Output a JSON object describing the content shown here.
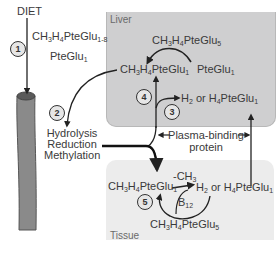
{
  "regions": {
    "liver": "Liver",
    "tissue": "Tissue"
  },
  "diet": {
    "label": "DIET",
    "compound_main": "CH3H4PteGlu",
    "compound_main_sub": "1-8",
    "compound_secondary": "PteGlu",
    "compound_secondary_sub": "1"
  },
  "steps": [
    "1",
    "2",
    "3",
    "4",
    "5"
  ],
  "gut": {
    "process_lines": [
      "Hydrolysis",
      "Reduction",
      "Methylation"
    ]
  },
  "liver": {
    "ch3h4pteglu5": "CH3H4PteGlu5",
    "ch3h4pteglu1": "CH3H4PteGlu1",
    "pteglu1": "PteGlu1",
    "h2_or_h4pteglu1": "H2 or H4PteGlu1"
  },
  "plasma": {
    "line1": "Plasma-binding",
    "line2": "protein"
  },
  "tissue": {
    "ch3h4pteglu1": "CH3H4PteGlu1",
    "methyl_label": "-CH3",
    "h2_or_h4pteglu1": "H2 or H4PteGlu1",
    "cofactor": "B12",
    "ch3h4pteglu5": "CH3H4PteGlu5"
  },
  "colors": {
    "liver_fill": "#cfcfd0",
    "tissue_fill": "#ececec",
    "gut_fill": "#8a8a8a",
    "text": "#3a3a3a"
  }
}
